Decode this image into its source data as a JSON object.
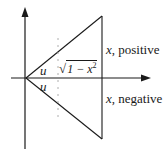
{
  "diagram": {
    "type": "geometric-axes-triangle",
    "colors": {
      "line": "#1a1a1a",
      "dashed": "#9a9a9a",
      "background": "#ffffff"
    },
    "labels": {
      "angle_upper": "u",
      "angle_lower": "u",
      "sqrt_expr": "1 − x",
      "sqrt_exponent": "2",
      "x_positive_var": "x",
      "x_positive_text": ", positive",
      "x_negative_var": "x",
      "x_negative_text": ", negative"
    },
    "geometry": {
      "origin": [
        26,
        78
      ],
      "top_vertex": [
        102,
        16
      ],
      "bottom_vertex": [
        102,
        139
      ],
      "x_axis": {
        "from": [
          11,
          78
        ],
        "to": [
          150,
          78
        ]
      },
      "y_axis": {
        "from": [
          25,
          149
        ],
        "to": [
          25,
          8
        ]
      },
      "dashed_vertical_x": 58
    }
  }
}
